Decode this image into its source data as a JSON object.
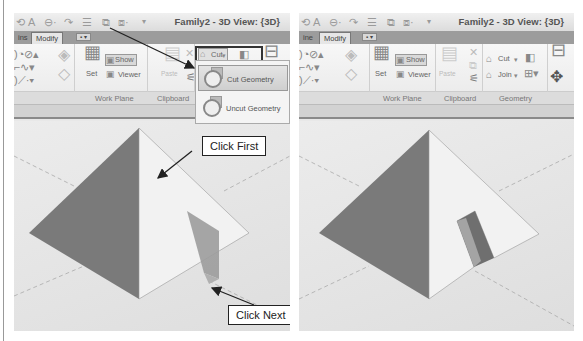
{
  "left_panel": {
    "title": "Family2 - 3D View: {3D}",
    "tabs": [
      {
        "label": "ins"
      },
      {
        "label": "Modify"
      },
      {
        "label": "▪ ▾"
      }
    ],
    "ribbon": {
      "set_label": "Set",
      "show_label": "Show",
      "viewer_label": "Viewer",
      "paste_label": "Paste",
      "cut_label": "Cut",
      "groups": [
        "Work Plane",
        "Clipboard"
      ]
    },
    "dropdown": {
      "items": [
        {
          "label": "Cut Geometry",
          "icon": "cut-geometry-icon"
        },
        {
          "label": "Uncut Geometry",
          "icon": "uncut-geometry-icon"
        }
      ]
    },
    "callouts": {
      "first": "Click First",
      "next": "Click Next"
    }
  },
  "right_panel": {
    "title": "Family2 - 3D View: {3D}",
    "tabs": [
      {
        "label": "ine"
      },
      {
        "label": "Modify"
      },
      {
        "label": "▪ ▾"
      }
    ],
    "ribbon": {
      "set_label": "Set",
      "show_label": "Show",
      "viewer_label": "Viewer",
      "paste_label": "Paste",
      "cut_label": "Cut",
      "join_label": "Join",
      "groups": [
        "Work Plane",
        "Clipboard",
        "Geometry"
      ]
    }
  },
  "colors": {
    "dark_face": "#7a7a7a",
    "light_face": "#f2f2f2",
    "cut_face": "#9c9c9c",
    "tab_bar": "#9c9c9c"
  }
}
